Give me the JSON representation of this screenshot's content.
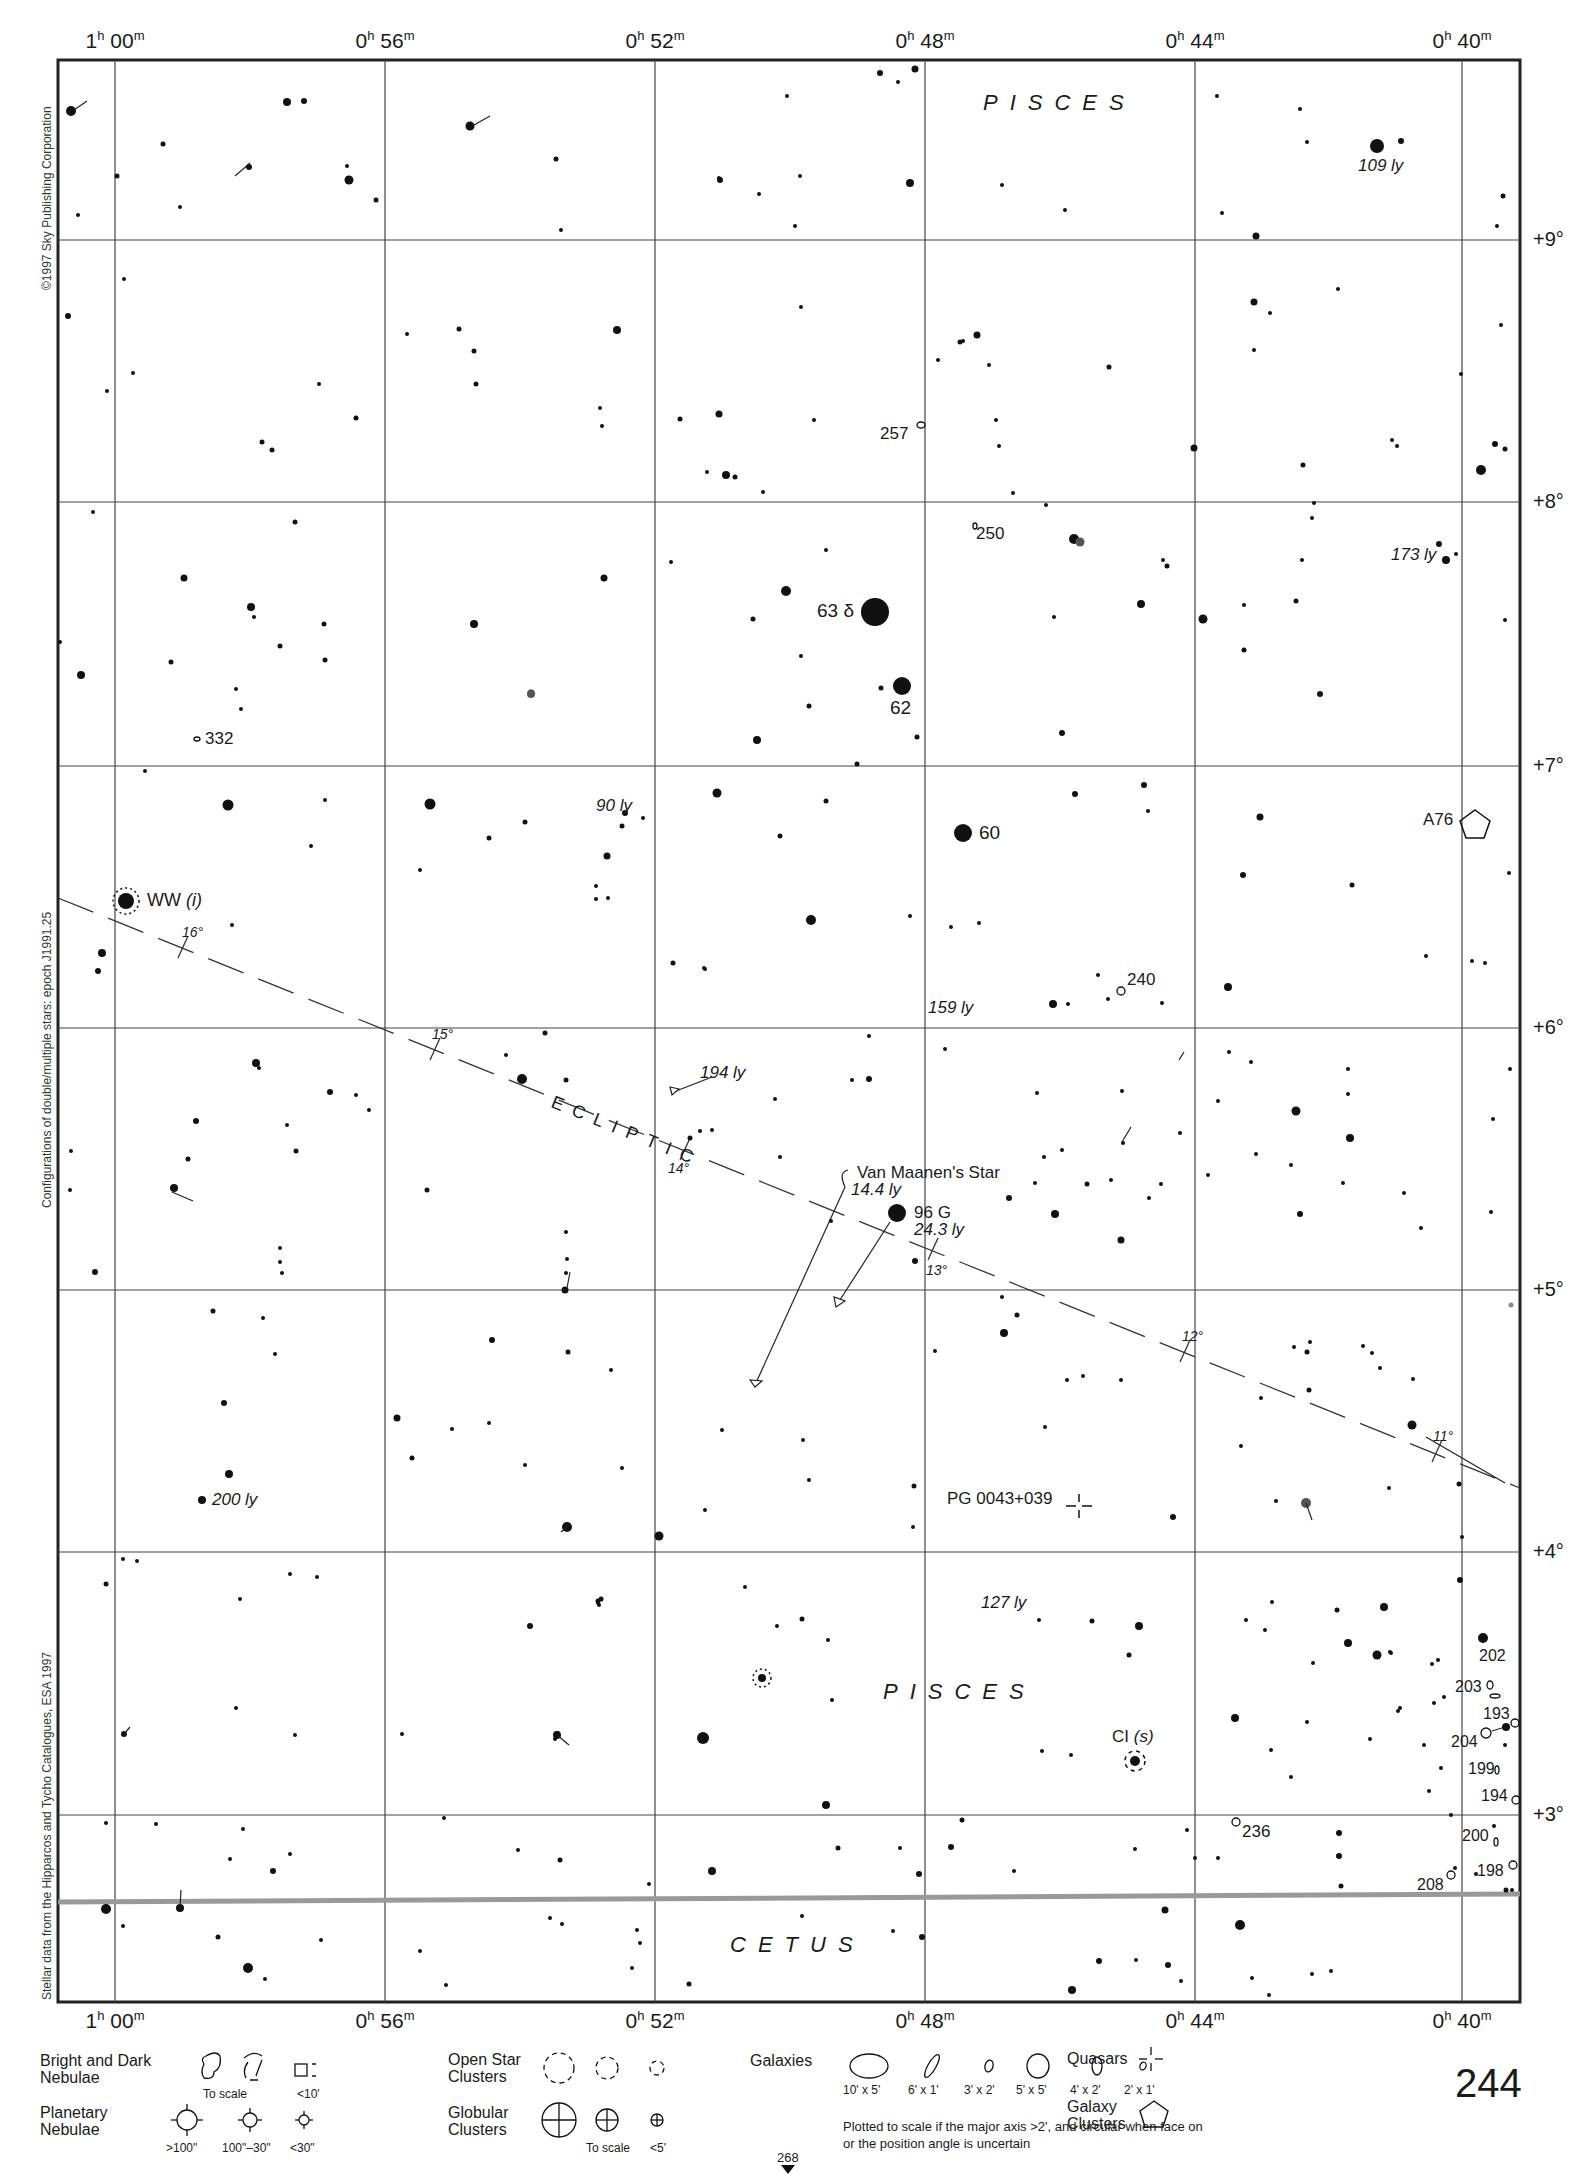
{
  "chart": {
    "ra_labels_top": [
      "1h 00m",
      "0h 56m",
      "0h 52m",
      "0h 48m",
      "0h 44m",
      "0h 40m"
    ],
    "ra_labels_bottom": [
      "1h 00m",
      "0h 56m",
      "0h 52m",
      "0h 48m",
      "0h 44m",
      "0h 40m"
    ],
    "ra_hours": [
      "1",
      "0",
      "0",
      "0",
      "0",
      "0"
    ],
    "ra_minutes": [
      "00",
      "56",
      "52",
      "48",
      "44",
      "40"
    ],
    "dec_labels": [
      "+9°",
      "+8°",
      "+7°",
      "+6°",
      "+5°",
      "+4°",
      "+3°"
    ],
    "side_notes": {
      "copyright": "©1997 Sky Publishing Corporation",
      "epoch": "Configurations of double/multiple stars: epoch J1991.25",
      "source": "Stellar data from the Hipparcos and Tycho Catalogues, ESA 1997"
    },
    "constellations": {
      "pisces_top": "PISCES",
      "pisces_mid": "PISCES",
      "cetus": "CETUS"
    },
    "ecliptic": {
      "label": "ECLIPTIC",
      "ticks": [
        "16°",
        "15°",
        "14°",
        "13°",
        "12°",
        "11°"
      ]
    },
    "star_labels": {
      "s109": "109 ly",
      "s257": "257",
      "s250": "250",
      "s173": "173 ly",
      "s63": "63 δ",
      "s62": "62",
      "s332": "332",
      "s90": "90 ly",
      "s60": "60",
      "a76": "A76",
      "ww": "WW",
      "ww_type": "(i)",
      "s240": "240",
      "s159": "159 ly",
      "s194ly": "194 ly",
      "van_maanen": "Van Maanen's Star",
      "van_maanen_dist": "14.4 ly",
      "s96g": "96 G",
      "s96g_dist": "24.3 ly",
      "s200ly": "200 ly",
      "pg": "PG 0043+039",
      "s127": "127 ly",
      "ci": "CI",
      "ci_type": "(s)",
      "g202": "202",
      "g203": "203",
      "g193": "193",
      "g204": "204",
      "g199": "199",
      "g194": "194",
      "g236": "236",
      "g200": "200",
      "g198": "198",
      "g208": "208"
    }
  },
  "legend": {
    "nebulae": {
      "title": "Bright and Dark Nebulae",
      "cap_scale": "To scale",
      "cap_small": "<10'"
    },
    "planetary": {
      "title": "Planetary Nebulae",
      "caps": [
        ">100\"",
        "100\"–30\"",
        "<30\""
      ]
    },
    "open_clusters": {
      "title": "Open Star Clusters"
    },
    "globular": {
      "title": "Globular Clusters",
      "cap_scale": "To scale",
      "cap_small": "<5'"
    },
    "galaxies": {
      "title": "Galaxies",
      "sizes": [
        "10' x 5'",
        "6' x 1'",
        "3' x 2'",
        "5' x 5'",
        "4' x 2'",
        "2' x 1'"
      ],
      "note": "Plotted to scale if the major axis >2', and circular when face on or the position angle is uncertain"
    },
    "quasars": {
      "title": "Quasars"
    },
    "galaxy_clusters": {
      "title": "Galaxy Clusters"
    }
  },
  "page": {
    "number": "244",
    "next_page": "268"
  }
}
